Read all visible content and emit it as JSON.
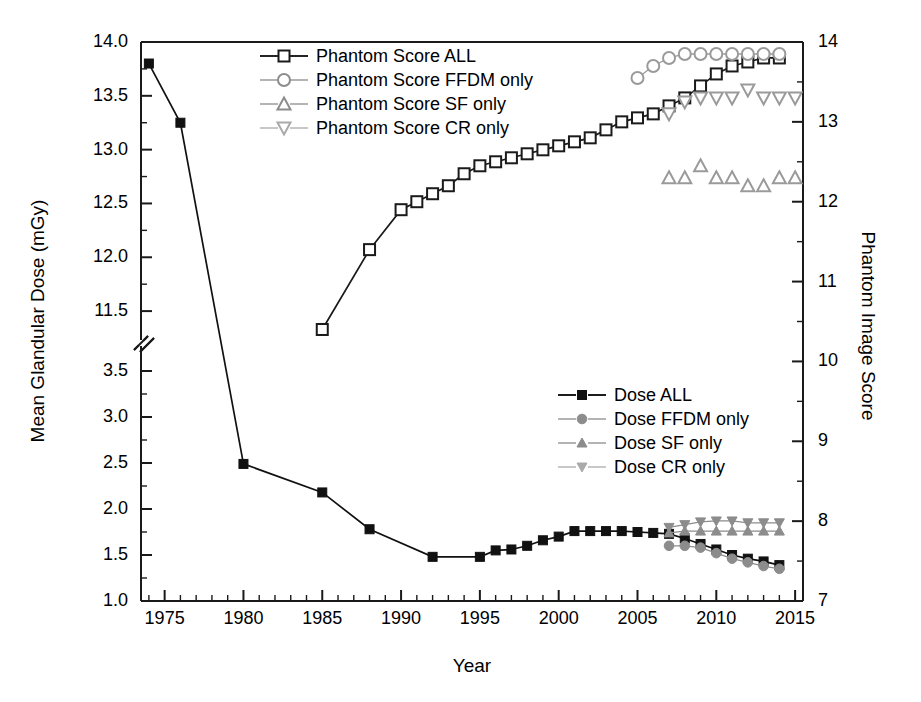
{
  "chart_data": {
    "type": "line",
    "title": "",
    "xlabel": "Year",
    "ylabel": "Mean Glandular Dose (mGy)",
    "ylabel_right": "Phantom Image Score",
    "xlim": [
      1973.5,
      2015.5
    ],
    "xticks": [
      1975,
      1980,
      1985,
      1990,
      1995,
      2000,
      2005,
      2010,
      2015
    ],
    "xtick_labels": [
      "1975",
      "1980",
      "1985",
      "1990",
      "1995",
      "2000",
      "2005",
      "2010",
      "2015"
    ],
    "x_minor_tick_interval": 1,
    "yticks_left": [
      1.0,
      1.5,
      2.0,
      2.5,
      3.0,
      3.5,
      11.5,
      12.0,
      12.5,
      13.0,
      13.5,
      14.0
    ],
    "ytick_labels_left": [
      "1.0",
      "1.5",
      "2.0",
      "2.5",
      "3.0",
      "3.5",
      "11.5",
      "12.0",
      "12.5",
      "13.0",
      "13.5",
      "14.0"
    ],
    "y_axis_break": true,
    "y_break_between": [
      3.5,
      11.5
    ],
    "ylim_left_lower": [
      1.0,
      3.75
    ],
    "ylim_left_upper": [
      11.25,
      14.0
    ],
    "yticks_right": [
      7,
      8,
      9,
      10,
      11,
      12,
      13,
      14
    ],
    "ytick_labels_right": [
      "7",
      "8",
      "9",
      "10",
      "11",
      "12",
      "13",
      "14"
    ],
    "ylim_right": [
      7,
      14
    ],
    "grid": false,
    "legend_position": [
      "upper-center",
      "center-right"
    ],
    "series": [
      {
        "name": "Phantom Score ALL",
        "axis": "right",
        "marker": "open-square",
        "color": "#1a1a1a",
        "line": true,
        "x": [
          1985,
          1988,
          1990,
          1991,
          1992,
          1993,
          1994,
          1995,
          1996,
          1997,
          1998,
          1999,
          2000,
          2001,
          2002,
          2003,
          2004,
          2005,
          2006,
          2007,
          2008,
          2009,
          2010,
          2011,
          2012,
          2013,
          2014
        ],
        "y": [
          10.4,
          11.4,
          11.9,
          12.0,
          12.1,
          12.2,
          12.35,
          12.45,
          12.5,
          12.55,
          12.6,
          12.65,
          12.7,
          12.75,
          12.8,
          12.9,
          13.0,
          13.05,
          13.1,
          13.2,
          13.3,
          13.45,
          13.6,
          13.7,
          13.75,
          13.8,
          13.8
        ]
      },
      {
        "name": "Phantom Score FFDM only",
        "axis": "right",
        "marker": "open-circle",
        "color": "#9a9a9a",
        "line": true,
        "x": [
          2005,
          2006,
          2007,
          2008,
          2009,
          2010,
          2011,
          2012,
          2013,
          2014
        ],
        "y": [
          13.55,
          13.7,
          13.8,
          13.85,
          13.85,
          13.85,
          13.85,
          13.85,
          13.85,
          13.85
        ]
      },
      {
        "name": "Phantom Score SF only",
        "axis": "right",
        "marker": "open-triangle-up",
        "color": "#9a9a9a",
        "line": false,
        "x": [
          2007,
          2008,
          2009,
          2010,
          2011,
          2012,
          2013,
          2014,
          2015
        ],
        "y": [
          12.3,
          12.3,
          12.45,
          12.3,
          12.3,
          12.2,
          12.2,
          12.3,
          12.3
        ]
      },
      {
        "name": "Phantom Score CR only",
        "axis": "right",
        "marker": "open-triangle-down",
        "color": "#9a9a9a",
        "line": false,
        "x": [
          2007,
          2008,
          2009,
          2010,
          2011,
          2012,
          2013,
          2014,
          2015
        ],
        "y": [
          13.1,
          13.25,
          13.3,
          13.3,
          13.3,
          13.4,
          13.3,
          13.3,
          13.3
        ]
      },
      {
        "name": "Dose ALL",
        "axis": "left",
        "marker": "filled-square",
        "color": "#111111",
        "line": true,
        "x": [
          1974,
          1976,
          1980,
          1985,
          1988,
          1992,
          1995,
          1996,
          1997,
          1998,
          1999,
          2000,
          2001,
          2002,
          2003,
          2004,
          2005,
          2006,
          2007,
          2008,
          2009,
          2010,
          2011,
          2012,
          2013,
          2014
        ],
        "y": [
          13.8,
          13.25,
          2.49,
          2.18,
          1.78,
          1.48,
          1.48,
          1.55,
          1.56,
          1.6,
          1.66,
          1.7,
          1.76,
          1.76,
          1.76,
          1.76,
          1.75,
          1.74,
          1.73,
          1.68,
          1.62,
          1.56,
          1.5,
          1.46,
          1.43,
          1.39
        ]
      },
      {
        "name": "Dose FFDM only",
        "axis": "left",
        "marker": "filled-circle",
        "color": "#8c8c8c",
        "line": true,
        "x": [
          2007,
          2008,
          2009,
          2010,
          2011,
          2012,
          2013,
          2014
        ],
        "y": [
          1.6,
          1.6,
          1.58,
          1.52,
          1.46,
          1.42,
          1.38,
          1.35
        ]
      },
      {
        "name": "Dose SF only",
        "axis": "left",
        "marker": "filled-triangle-up",
        "color": "#8c8c8c",
        "line": true,
        "x": [
          2007,
          2008,
          2009,
          2010,
          2011,
          2012,
          2013,
          2014
        ],
        "y": [
          1.74,
          1.76,
          1.76,
          1.76,
          1.76,
          1.76,
          1.76,
          1.76
        ]
      },
      {
        "name": "Dose CR only",
        "axis": "left",
        "marker": "filled-triangle-down",
        "color": "#8c8c8c",
        "line": true,
        "x": [
          2007,
          2008,
          2009,
          2010,
          2011,
          2012,
          2013,
          2014
        ],
        "y": [
          1.8,
          1.83,
          1.86,
          1.87,
          1.87,
          1.85,
          1.85,
          1.85
        ]
      }
    ]
  },
  "legend_top": {
    "items": [
      {
        "label": "Phantom Score ALL",
        "marker": "open-square",
        "color": "#1a1a1a"
      },
      {
        "label": "Phantom Score FFDM only",
        "marker": "open-circle",
        "color": "#8c8c8c"
      },
      {
        "label": "Phantom Score SF only",
        "marker": "open-triangle-up",
        "color": "#8c8c8c"
      },
      {
        "label": "Phantom Score CR only",
        "marker": "open-triangle-down",
        "color": "#aaaaaa"
      }
    ]
  },
  "legend_bottom": {
    "items": [
      {
        "label": "Dose ALL",
        "marker": "filled-square",
        "color": "#111111"
      },
      {
        "label": "Dose FFDM only",
        "marker": "filled-circle",
        "color": "#8c8c8c"
      },
      {
        "label": "Dose SF only",
        "marker": "filled-triangle-up",
        "color": "#8c8c8c"
      },
      {
        "label": "Dose CR only",
        "marker": "filled-triangle-down",
        "color": "#aaaaaa"
      }
    ]
  },
  "colors": {
    "axis": "#1a1a1a",
    "primary": "#111111",
    "secondary": "#8c8c8c",
    "light": "#aaaaaa",
    "background": "#ffffff"
  }
}
